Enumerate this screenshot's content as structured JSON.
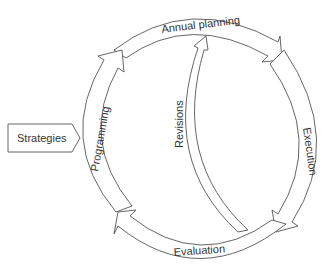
{
  "diagram": {
    "input_box": {
      "label": "Strategies"
    },
    "cycle_stages": [
      {
        "id": "annual-planning",
        "label": "Annual planning"
      },
      {
        "id": "execution",
        "label": "Execution"
      },
      {
        "id": "evaluation",
        "label": "Evaluation"
      },
      {
        "id": "programming",
        "label": "Programming"
      }
    ],
    "feedback_arrow": {
      "label": "Revisions",
      "from": "Evaluation",
      "to": "Annual planning"
    },
    "colors": {
      "stroke": "#555555",
      "fill": "#ffffff",
      "text": "#333333"
    }
  }
}
